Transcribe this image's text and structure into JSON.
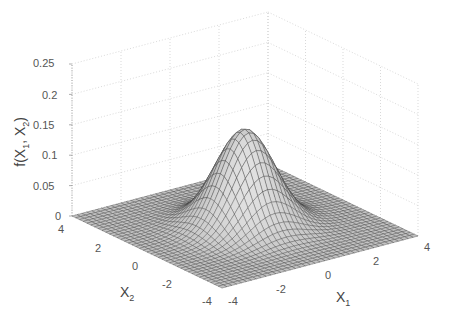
{
  "chart_data": {
    "type": "surface3d",
    "title": "",
    "xlabel": "X1",
    "ylabel": "X2",
    "zlabel": "f(X1, X2)",
    "xlim": [
      -4,
      4
    ],
    "ylim": [
      -4,
      4
    ],
    "zlim": [
      0,
      0.25
    ],
    "x_ticks": [
      "-4",
      "-2",
      "0",
      "2",
      "4"
    ],
    "y_ticks": [
      "-4",
      "-2",
      "0",
      "2",
      "4"
    ],
    "z_ticks": [
      "0",
      "0.05",
      "0.1",
      "0.15",
      "0.2",
      "0.25"
    ],
    "peak": {
      "x1": 0,
      "x2": 0,
      "value": 0.159
    },
    "grid": true,
    "colormap": "gray",
    "mesh_resolution": 41
  },
  "labels": {
    "z_axis": "f(X",
    "z_sub1": "1",
    "z_mid": ", X",
    "z_sub2": "2",
    "z_end": ")",
    "x1_main": "X",
    "x1_sub": "1",
    "x2_main": "X",
    "x2_sub": "2"
  },
  "ticks": {
    "z": [
      "0",
      "0.05",
      "0.1",
      "0.15",
      "0.2",
      "0.25"
    ],
    "x1": [
      "-4",
      "-2",
      "0",
      "2",
      "4"
    ],
    "x2": [
      "4",
      "2",
      "0",
      "-2",
      "-4"
    ]
  }
}
